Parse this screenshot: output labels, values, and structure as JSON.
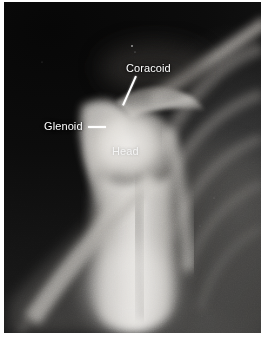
{
  "figure": {
    "kind": "radiograph",
    "modality": "x-ray",
    "view": "shoulder, axillary / scapular-Y projection",
    "border_color": "#ffffff",
    "film_background_color": "#0b0b0b",
    "label_color": "#ffffff"
  },
  "labels": [
    {
      "id": "coracoid",
      "text": "Coracoid",
      "leader": "diagonal-line",
      "leader_direction": "down-left"
    },
    {
      "id": "glenoid",
      "text": "Glenoid",
      "leader": "horizontal-dash",
      "leader_direction": "right"
    },
    {
      "id": "head",
      "text": "Head",
      "leader": "none",
      "leader_direction": "none"
    }
  ],
  "anatomy": {
    "coracoid_process": "Coracoid",
    "glenoid_fossa": "Glenoid",
    "humeral_head": "Head"
  },
  "icons": {
    "coracoid_leader": "leader-line-icon",
    "glenoid_leader": "leader-dash-icon"
  }
}
